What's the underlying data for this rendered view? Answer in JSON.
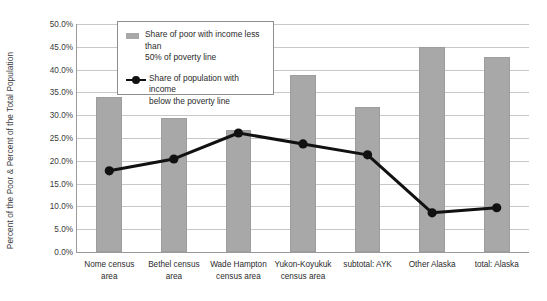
{
  "chart_data": {
    "type": "bar",
    "title": "",
    "subtitle": "",
    "xlabel": "",
    "ylabel": "Percent of the Poor & Percent of the Total Population",
    "ylim": [
      0,
      50
    ],
    "ytick_step": 5,
    "ytick_labels": [
      "50.0%",
      "45.0%",
      "40.0%",
      "35.0%",
      "30.0%",
      "25.0%",
      "20.0%",
      "15.0%",
      "10.0%",
      "5.0%",
      "0.0%"
    ],
    "ytick_values": [
      50,
      45,
      40,
      35,
      30,
      25,
      20,
      15,
      10,
      5,
      0
    ],
    "grid": true,
    "legend_position": "top-left-inside",
    "categories": [
      "Nome census\narea",
      "Bethel census\narea",
      "Wade Hampton\ncensus area",
      "Yukon-Koyukuk\ncensus area",
      "subtotal: AYK",
      "Other Alaska",
      "total: Alaska"
    ],
    "series": [
      {
        "name": "Share of poor with income less than\n50% of poverty line",
        "render": "bar",
        "color": "#a8a8a8",
        "values": [
          34.1,
          29.3,
          26.8,
          38.8,
          31.8,
          45.0,
          42.8
        ]
      },
      {
        "name": "Share of population with income\nbelow the poverty line",
        "render": "line",
        "color": "#111111",
        "marker": "circle",
        "values": [
          17.8,
          20.4,
          26.1,
          23.7,
          21.3,
          8.6,
          9.7
        ]
      }
    ]
  }
}
